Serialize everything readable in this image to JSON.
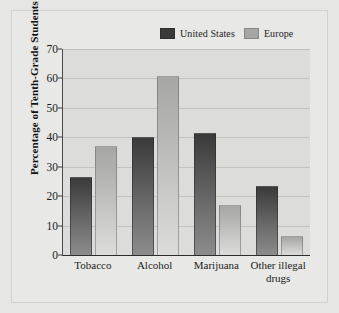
{
  "chart_data": {
    "type": "bar",
    "title": "",
    "xlabel": "",
    "ylabel": "Percentage of Tenth-Grade Students",
    "categories": [
      "Tobacco",
      "Alcohol",
      "Marijuana",
      "Other illegal drugs"
    ],
    "series": [
      {
        "name": "United States",
        "color": "#3a3a3a",
        "values": [
          26.5,
          40,
          41.5,
          23.5
        ]
      },
      {
        "name": "Europe",
        "color": "#a6a6a4",
        "values": [
          37,
          61,
          17,
          6.5
        ]
      }
    ],
    "ylim": [
      0,
      70
    ],
    "yticks": [
      0,
      10,
      20,
      30,
      40,
      50,
      60,
      70
    ],
    "ytick_labels": [
      "0",
      "10",
      "20",
      "30",
      "40",
      "50",
      "60",
      "70"
    ],
    "grid": true,
    "legend_position": "top-right"
  },
  "legend": {
    "entries": [
      {
        "label": "United States",
        "swatch": "legend-swatch-united-states"
      },
      {
        "label": "Europe",
        "swatch": "legend-swatch-europe"
      }
    ]
  },
  "xlabels": {
    "tobacco": "Tobacco",
    "alcohol": "Alcohol",
    "marijuana": "Marijuana",
    "other_line1": "Other illegal",
    "other_line2": "drugs"
  },
  "colors": {
    "figure_background": "#e6e6e4",
    "plot_background": "#dcdcda",
    "gridline": "#c2c2bf",
    "axis": "#2d2d2d",
    "text": "#1c1c1c",
    "us_bar_top": "#3a3a3a",
    "us_bar_bottom": "#8c8c8c",
    "eu_bar_top": "#a6a6a4",
    "eu_bar_bottom": "#dcdcda"
  }
}
